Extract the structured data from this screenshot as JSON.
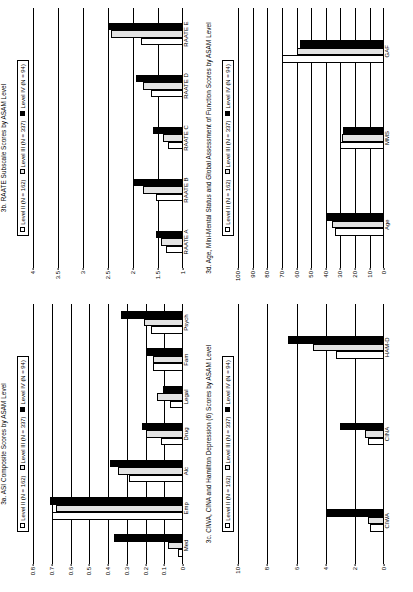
{
  "figure": {
    "background": "#ffffff",
    "bar_colors": {
      "level_ii": "#ffffff",
      "level_iii": "#e3e3e3",
      "level_iv": "#000000"
    }
  },
  "legend": {
    "level_ii": "Level II (N = 162)",
    "level_iii": "Level III (N = 337)",
    "level_iv": "Level IV (N = 94)"
  },
  "panels": {
    "p3a": {
      "title": "3a. ASI Composite Scores by ASAM Level"
    },
    "p3b": {
      "title": "3b. RAATE Subscale Scores by ASAM Level"
    },
    "p3c": {
      "title": "3c. CIWA, CINA and Hamilton Depression (6) Scores by ASAM Level"
    },
    "p3d": {
      "title": "3d. Age, Mini-Mental Status and Global Assessment of Function Scores by ASAM Level"
    }
  },
  "chart_data": [
    {
      "id": "3a",
      "type": "bar",
      "title": "3a. ASI Composite Scores by ASAM Level",
      "xlabel": "",
      "ylabel": "",
      "ylim": [
        0,
        0.8
      ],
      "yticks": [
        0,
        0.1,
        0.2,
        0.3,
        0.4,
        0.5,
        0.6,
        0.7,
        0.8
      ],
      "ytick_labels": [
        "0",
        "0.1",
        "0.2",
        "0.3",
        "0.4",
        "0.5",
        "0.6",
        "0.7",
        "0.8"
      ],
      "grid": true,
      "legend_position": "top",
      "categories": [
        "Med",
        "Emp",
        "Alc",
        "Drug",
        "Legal",
        "Fam",
        "Psych"
      ],
      "series": [
        {
          "name": "Level II (N = 162)",
          "fill": "#ffffff",
          "values": [
            0.03,
            0.7,
            0.29,
            0.12,
            0.07,
            0.16,
            0.17
          ]
        },
        {
          "name": "Level III (N = 337)",
          "fill": "#e3e3e3",
          "values": [
            0.08,
            0.68,
            0.35,
            0.2,
            0.14,
            0.16,
            0.21
          ]
        },
        {
          "name": "Level IV (N = 94)",
          "fill": "#000000",
          "values": [
            0.37,
            0.71,
            0.39,
            0.22,
            0.11,
            0.2,
            0.33
          ]
        }
      ]
    },
    {
      "id": "3b",
      "type": "bar",
      "title": "3b. RAATE Subscale Scores by ASAM Level",
      "xlabel": "",
      "ylabel": "",
      "ylim": [
        1,
        4
      ],
      "yticks": [
        1,
        1.5,
        2,
        2.5,
        3,
        3.5,
        4
      ],
      "ytick_labels": [
        "1",
        "1.5",
        "2",
        "2.5",
        "3",
        "3.5",
        "4"
      ],
      "grid": true,
      "legend_position": "top",
      "categories": [
        "RAATE A",
        "RAATE B",
        "RAATE C",
        "RAATE D",
        "RAATE E"
      ],
      "series": [
        {
          "name": "Level II (N = 162)",
          "fill": "#ffffff",
          "values": [
            1.35,
            1.55,
            1.3,
            1.65,
            1.85
          ]
        },
        {
          "name": "Level III (N = 337)",
          "fill": "#e3e3e3",
          "values": [
            1.45,
            1.8,
            1.4,
            1.8,
            2.45
          ]
        },
        {
          "name": "Level IV (N = 94)",
          "fill": "#000000",
          "values": [
            1.55,
            2.0,
            1.6,
            1.95,
            2.5
          ]
        }
      ]
    },
    {
      "id": "3c",
      "type": "bar",
      "title": "3c. CIWA, CINA and Hamilton Depression (6) Scores by ASAM Level",
      "xlabel": "",
      "ylabel": "",
      "ylim": [
        0,
        10
      ],
      "yticks": [
        0,
        2,
        4,
        6,
        8,
        10
      ],
      "ytick_labels": [
        "0",
        "2",
        "4",
        "6",
        "8",
        "10"
      ],
      "grid": true,
      "legend_position": "top",
      "categories": [
        "CIWA",
        "CINA",
        "HAM-D"
      ],
      "series": [
        {
          "name": "Level II (N = 162)",
          "fill": "#ffffff",
          "values": [
            1.0,
            1.1,
            3.3
          ]
        },
        {
          "name": "Level III (N = 337)",
          "fill": "#e3e3e3",
          "values": [
            1.1,
            1.3,
            4.9
          ]
        },
        {
          "name": "Level IV (N = 94)",
          "fill": "#000000",
          "values": [
            4.0,
            3.0,
            6.6
          ]
        }
      ]
    },
    {
      "id": "3d",
      "type": "bar",
      "title": "3d. Age, Mini-Mental Status and Global Assessment of Function Scores by ASAM Level",
      "xlabel": "",
      "ylabel": "",
      "ylim": [
        0,
        100
      ],
      "yticks": [
        0,
        10,
        20,
        30,
        40,
        50,
        60,
        70,
        80,
        90,
        100
      ],
      "ytick_labels": [
        "0",
        "10",
        "20",
        "30",
        "40",
        "50",
        "60",
        "70",
        "80",
        "90",
        "100"
      ],
      "grid": true,
      "legend_position": "top",
      "categories": [
        "Age",
        "MMS",
        "GAF"
      ],
      "series": [
        {
          "name": "Level II (N = 162)",
          "fill": "#ffffff",
          "values": [
            34,
            30,
            70
          ]
        },
        {
          "name": "Level III (N = 337)",
          "fill": "#e3e3e3",
          "values": [
            36,
            29,
            60
          ]
        },
        {
          "name": "Level IV (N = 94)",
          "fill": "#000000",
          "values": [
            40,
            28,
            58
          ]
        }
      ]
    }
  ]
}
